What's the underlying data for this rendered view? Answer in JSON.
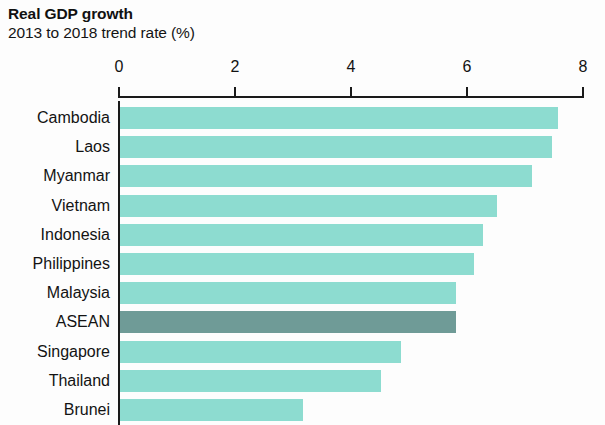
{
  "chart_data": {
    "type": "bar",
    "orientation": "horizontal",
    "title": "Real GDP growth",
    "subtitle": "2013 to 2018 trend rate (%)",
    "xlabel": "",
    "ylabel": "",
    "xlim": [
      0,
      8
    ],
    "xticks": [
      0,
      2,
      4,
      6,
      8
    ],
    "xtick_labels": [
      "0",
      "2",
      "4",
      "6",
      "8"
    ],
    "grid": false,
    "legend": "none",
    "bar_color": "#8ddcd0",
    "highlight_color": "#6f9b97",
    "highlight_category": "ASEAN",
    "note": "Bottom bar (Brunei) is clipped by the image edge",
    "categories": [
      "Cambodia",
      "Laos",
      "Myanmar",
      "Vietnam",
      "Indonesia",
      "Philippines",
      "Malaysia",
      "ASEAN",
      "Singapore",
      "Thailand",
      "Brunei"
    ],
    "values": [
      7.55,
      7.45,
      7.1,
      6.5,
      6.25,
      6.1,
      5.8,
      5.8,
      4.85,
      4.5,
      3.15
    ]
  }
}
